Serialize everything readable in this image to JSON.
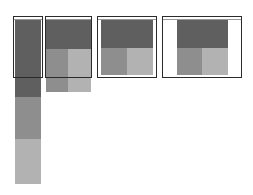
{
  "diagram": {
    "title": "",
    "colors": {
      "frame_border": "#2b2b2b",
      "block_primary": "#5f5f5f",
      "block_secondary": "#8e8e8e",
      "block_tertiary": "#b2b2b2",
      "background": "#ffffff"
    },
    "viewports": [
      {
        "id": "phone",
        "label": "",
        "layout": "stacked",
        "blocks": [
          "primary",
          "secondary",
          "tertiary"
        ]
      },
      {
        "id": "tablet",
        "label": "",
        "layout": "header-two-col",
        "blocks": [
          "primary",
          "secondary",
          "tertiary"
        ]
      },
      {
        "id": "laptop",
        "label": "",
        "layout": "header-two-col",
        "blocks": [
          "primary",
          "secondary",
          "tertiary"
        ]
      },
      {
        "id": "desktop",
        "label": "",
        "layout": "header-two-col-centered",
        "blocks": [
          "primary",
          "secondary",
          "tertiary"
        ]
      }
    ]
  }
}
